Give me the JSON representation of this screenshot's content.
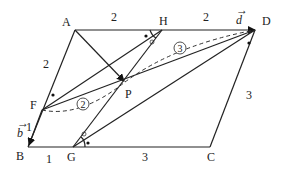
{
  "diagram": {
    "points": {
      "A": "A",
      "H": "H",
      "D": "D",
      "B": "B",
      "G": "G",
      "C": "C",
      "F": "F",
      "P": "P"
    },
    "segment_labels": {
      "AH": "2",
      "HD": "2",
      "AF": "2",
      "FB": "1",
      "BG": "1",
      "GC": "3",
      "CD": "3"
    },
    "vectors": {
      "d": "d",
      "b": "b",
      "arrow": "→"
    },
    "ratio_marks": {
      "FP": "2",
      "PD": "3"
    }
  }
}
